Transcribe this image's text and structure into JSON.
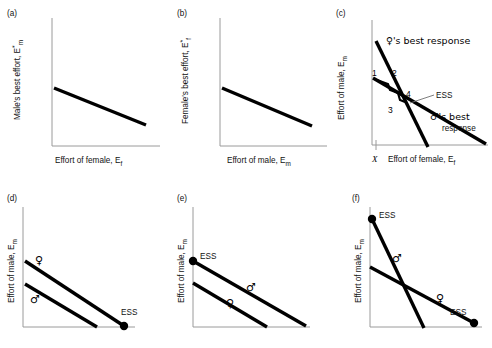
{
  "figure": {
    "panel_count": 6
  },
  "panels": {
    "a": {
      "tag": "(a)",
      "ylabel": "Male's best effort, E",
      "ylabel_sup": "*",
      "ylabel_sub": "m",
      "xlabel": "Effort of female, E",
      "xlabel_sub": "f",
      "lines": [
        {
          "name": "male-best-response",
          "x1": 0,
          "y1": 52,
          "x2": 100,
          "y2": 22
        }
      ]
    },
    "b": {
      "tag": "(b)",
      "ylabel": "Female's best effort, E",
      "ylabel_sup": "*",
      "ylabel_sub": "f",
      "xlabel": "Effort of male, E",
      "xlabel_sub": "m",
      "lines": [
        {
          "name": "female-best-response",
          "x1": 0,
          "y1": 52,
          "x2": 100,
          "y2": 20
        }
      ]
    },
    "c": {
      "tag": "(c)",
      "ylabel": "Effort of male, E",
      "ylabel_sub": "m",
      "xlabel": "Effort of female, E",
      "xlabel_sub": "f",
      "origin_tick_label": "X",
      "annotations": {
        "female_response": "♀'s best response",
        "male_response_line1": "♂'s best",
        "male_response_line2": "response",
        "ess": "ESS"
      },
      "steps": [
        "1",
        "2",
        "3",
        "4"
      ],
      "lines": [
        {
          "name": "female-best-response-steep",
          "x1": 5,
          "y1": 92,
          "x2": 62,
          "y2": 0
        },
        {
          "name": "male-best-response-shallow",
          "x1": 2,
          "y1": 56,
          "x2": 100,
          "y2": 2
        }
      ]
    },
    "d": {
      "tag": "(d)",
      "ylabel": "Effort of male, E",
      "ylabel_sub": "m",
      "annotations": {
        "female": "♀",
        "male": "♂",
        "ess": "ESS"
      },
      "lines": [
        {
          "name": "female-line-upper",
          "x1": 4,
          "y1": 72,
          "x2": 86,
          "y2": 0
        },
        {
          "name": "male-line-lower",
          "x1": 4,
          "y1": 50,
          "x2": 62,
          "y2": 0
        }
      ],
      "ess_points": [
        {
          "name": "ess-point-axis",
          "x": 86,
          "y": 0
        }
      ]
    },
    "e": {
      "tag": "(e)",
      "ylabel": "Effort of male, E",
      "ylabel_sub": "m",
      "annotations": {
        "male": "♂",
        "female": "♀",
        "ess": "ESS"
      },
      "lines": [
        {
          "name": "male-line-upper",
          "x1": 0,
          "y1": 72,
          "x2": 92,
          "y2": 0
        },
        {
          "name": "female-line-lower",
          "x1": 0,
          "y1": 52,
          "x2": 62,
          "y2": 0
        }
      ],
      "ess_points": [
        {
          "name": "ess-point-yaxis",
          "x": 0,
          "y": 72
        }
      ]
    },
    "f": {
      "tag": "(f)",
      "ylabel": "Effort of male, E",
      "ylabel_sub": "m",
      "annotations": {
        "male": "♂",
        "female": "♀",
        "ess_top": "ESS",
        "ess_bottom": "ESS"
      },
      "lines": [
        {
          "name": "male-line-steep",
          "x1": 4,
          "y1": 88,
          "x2": 50,
          "y2": 0
        },
        {
          "name": "female-line-shallow",
          "x1": 0,
          "y1": 52,
          "x2": 92,
          "y2": 4
        }
      ],
      "ess_points": [
        {
          "name": "ess-point-top-left",
          "x": 4,
          "y": 88
        },
        {
          "name": "ess-point-bottom-right",
          "x": 92,
          "y": 4
        }
      ]
    }
  },
  "colors": {
    "line": "#000000",
    "axis": "#9a9a9a",
    "text": "#111111",
    "leader": "#6f6f6f",
    "background": "#ffffff"
  }
}
